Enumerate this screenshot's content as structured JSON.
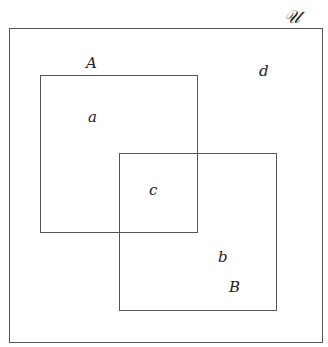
{
  "diagram": {
    "type": "venn",
    "universe": {
      "label": "𝒰"
    },
    "sets": [
      {
        "name": "A",
        "label": "A",
        "region_label": "a"
      },
      {
        "name": "B",
        "label": "B",
        "region_label": "b"
      }
    ],
    "intersection_label": "c",
    "outside_label": "d"
  }
}
